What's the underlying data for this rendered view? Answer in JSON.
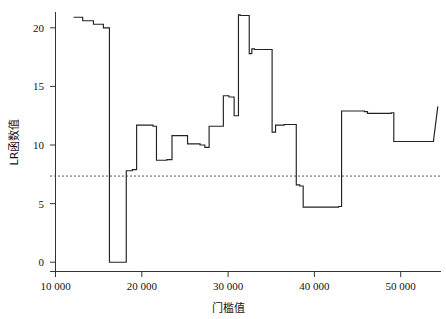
{
  "chart_data": {
    "type": "line",
    "title": "",
    "xlabel": "门槛值",
    "ylabel": "LR函数值",
    "xlim": [
      10000,
      54500
    ],
    "ylim": [
      -0.9,
      21.8
    ],
    "xticks": [
      10000,
      20000,
      30000,
      40000,
      50000
    ],
    "xticklabels": [
      "10 000",
      "20 000",
      "30 000",
      "40 000",
      "50 000"
    ],
    "yticks": [
      0,
      5,
      10,
      15,
      20
    ],
    "yticklabels": [
      "0",
      "5",
      "10",
      "15",
      "20"
    ],
    "grid": false,
    "legend": false,
    "line_color": "#222222",
    "threshold": {
      "value": 7.35,
      "label": "",
      "style": "dashed",
      "color": "#555555"
    },
    "series": [
      {
        "name": "LR统计量",
        "style": "step",
        "x": [
          12100,
          13150,
          13150,
          14400,
          14400,
          15550,
          15550,
          16250,
          16250,
          18200,
          18200,
          18900,
          18900,
          19400,
          19400,
          21300,
          21300,
          21700,
          21700,
          22900,
          22900,
          23500,
          23500,
          25300,
          25300,
          26750,
          26750,
          27300,
          27300,
          27800,
          27800,
          29450,
          29450,
          30100,
          30100,
          30700,
          30700,
          31200,
          31200,
          31400,
          31400,
          32450,
          32450,
          32750,
          32750,
          33050,
          33050,
          35100,
          35100,
          35500,
          35500,
          36500,
          36500,
          37900,
          37900,
          38300,
          38300,
          38700,
          38700,
          42800,
          42800,
          43150,
          43150,
          45800,
          45800,
          46150,
          46150,
          48900,
          48900,
          49200,
          49200,
          53800,
          53800,
          54300
        ],
        "y": [
          20.9,
          20.9,
          20.6,
          20.6,
          20.3,
          20.3,
          20.0,
          20.0,
          0.0,
          0.0,
          7.8,
          7.8,
          7.9,
          7.9,
          11.7,
          11.7,
          11.6,
          11.6,
          8.7,
          8.7,
          8.75,
          8.75,
          10.8,
          10.8,
          10.1,
          10.1,
          10.0,
          10.0,
          9.8,
          9.8,
          11.6,
          11.6,
          14.2,
          14.2,
          14.1,
          14.1,
          12.5,
          12.5,
          21.1,
          21.1,
          21.05,
          21.05,
          17.8,
          17.8,
          18.2,
          18.2,
          18.15,
          18.15,
          11.1,
          11.1,
          11.7,
          11.7,
          11.75,
          11.75,
          6.6,
          6.6,
          6.5,
          6.5,
          4.7,
          4.7,
          4.75,
          4.75,
          12.9,
          12.9,
          12.85,
          12.85,
          12.7,
          12.7,
          12.75,
          12.75,
          10.3,
          10.3,
          10.35,
          13.3
        ]
      }
    ],
    "annotations": []
  },
  "axes": {
    "y_label_text": "LR函数值",
    "x_label_text": "门槛值"
  }
}
